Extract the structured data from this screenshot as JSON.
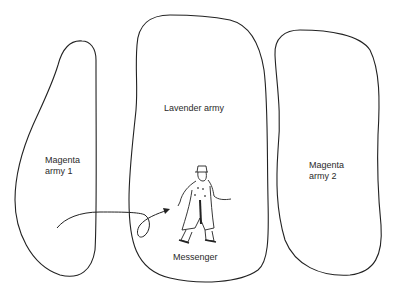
{
  "diagram": {
    "type": "illustration",
    "regions": [
      {
        "id": "magenta-army-1",
        "line1": "Magenta",
        "line2": "army 1"
      },
      {
        "id": "lavender-army",
        "label": "Lavender army"
      },
      {
        "id": "magenta-army-2",
        "line1": "Magenta",
        "line2": "army 2"
      }
    ],
    "messenger": {
      "label": "Messenger"
    },
    "colors": {
      "stroke": "#222222",
      "background": "#ffffff",
      "text": "#2a2a2a"
    }
  }
}
